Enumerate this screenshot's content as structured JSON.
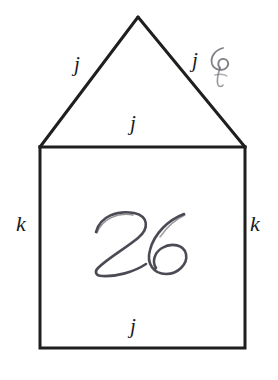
{
  "figure": {
    "kind": "geometry-diagram",
    "background_color": "#ffffff",
    "stroke_color": "#1f1f1f",
    "label_color": "#1a1a1a",
    "ink_color": "#3c3c46",
    "stroke_width": 3,
    "labels": {
      "triangle_left_side": "j",
      "triangle_right_side": "j",
      "triangle_base": "j",
      "square_bottom": "j",
      "square_left_side": "k",
      "square_right_side": "k"
    },
    "annotations": {
      "center_handwriting": "26",
      "scribble_note": ""
    },
    "geometry": {
      "apex": [
        138,
        17
      ],
      "top_left": [
        40,
        147
      ],
      "top_right": [
        245,
        147
      ],
      "bottom_left": [
        40,
        348
      ],
      "bottom_right": [
        245,
        348
      ]
    }
  }
}
